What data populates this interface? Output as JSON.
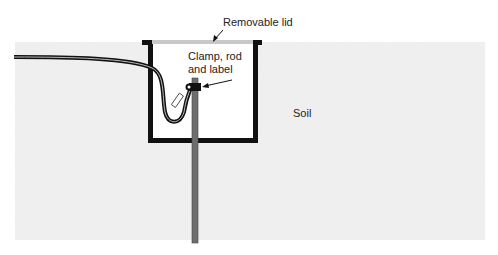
{
  "diagram": {
    "labels": {
      "lid": "Removable lid",
      "clamp_line1": "Clamp, rod",
      "clamp_line2": "and label",
      "soil": "Soil"
    },
    "colors": {
      "soil": "#ececec",
      "box_wall": "#111111",
      "lid": "#c8c8c8",
      "rod": "#6e6e6e",
      "cable": "#111111",
      "background": "#ffffff"
    }
  }
}
